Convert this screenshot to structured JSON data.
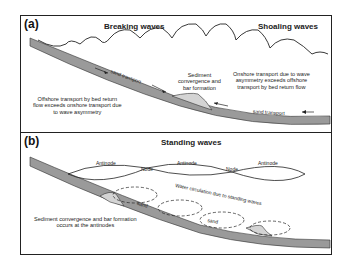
{
  "panel_a": {
    "id": "(a)",
    "title_left": "Breaking waves",
    "title_right": "Shoaling waves",
    "sand_transport_upper": "sand transport",
    "sand_transport_lower": "sand transport",
    "bar_caption_line1": "Sediment",
    "bar_caption_line2": "convergence and",
    "bar_caption_line3": "bar formation",
    "offshore_line1": "Offshore transport by bed return",
    "offshore_line2": "flow exceeds onshore transport due",
    "offshore_line3": "to wave asymmetry",
    "onshore_line1": "Onshore transport due to wave",
    "onshore_line2": "asymmetry exceeds offshore",
    "onshore_line3": "transport by bed return flow"
  },
  "panel_b": {
    "id": "(b)",
    "title": "Standing waves",
    "antinode_1": "Antinode",
    "node_1": "Node",
    "antinode_2": "Antinode",
    "node_2": "Node",
    "antinode_3": "Antinode",
    "circulation_label": "Water circulation due to standing waves",
    "sand_label_1": "sand",
    "sand_label_2": "sand",
    "caption_line1": "Sediment convergence and bar formation",
    "caption_line2": "occurs at the antinodes"
  },
  "colors": {
    "seabed": "#9a9a9a",
    "bar": "#d4d4d4",
    "line": "#222222"
  }
}
